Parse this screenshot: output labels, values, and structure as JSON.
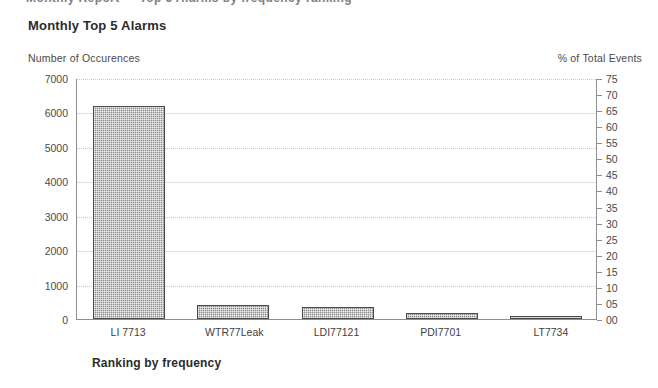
{
  "document": {
    "clipped_header_text": "Monthly Report — Top 5 Alarms by frequency ranking"
  },
  "chart_data": {
    "type": "bar",
    "title": "Monthly Top 5 Alarms",
    "xlabel": "Ranking by frequency",
    "ylabel": "Number of Occurences",
    "y2label": "% of Total Events",
    "categories": [
      "LI 7713",
      "WTR77Leak",
      "LDI77121",
      "PDI7701",
      "LT7734"
    ],
    "values": [
      6200,
      400,
      350,
      180,
      80
    ],
    "percent_values": [
      66.5,
      4.3,
      3.8,
      1.9,
      0.9
    ],
    "ylim": [
      0,
      7000
    ],
    "yticks": [
      0,
      1000,
      2000,
      3000,
      4000,
      5000,
      6000,
      7000
    ],
    "ytick_labels": [
      "0",
      "1000",
      "2000",
      "3000",
      "4000",
      "5000",
      "6000",
      "7000"
    ],
    "y2lim": [
      0,
      75
    ],
    "y2ticks": [
      0,
      5,
      10,
      15,
      20,
      25,
      30,
      35,
      40,
      45,
      50,
      55,
      60,
      65,
      70,
      75
    ],
    "y2tick_labels": [
      "00",
      "05",
      "10",
      "15",
      "20",
      "25",
      "30",
      "35",
      "40",
      "45",
      "50",
      "55",
      "60",
      "65",
      "70",
      "75"
    ],
    "grid": true,
    "legend": "none",
    "bar_fill_color": "#8d8d8d",
    "bar_border_color": "#4a4a4a",
    "axis_color": "#8e8e8e",
    "grid_color": "#c9c9c9",
    "background_color": "#ffffff"
  }
}
